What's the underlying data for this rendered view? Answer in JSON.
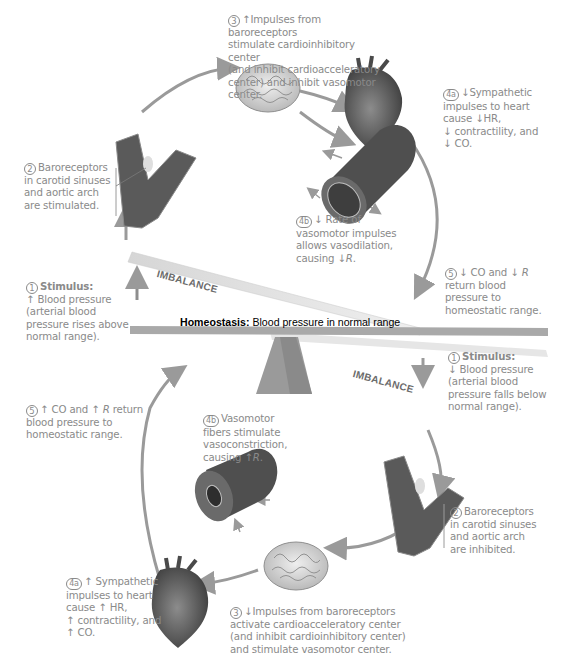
{
  "figure": {
    "header_fragment": "",
    "center": {
      "homeostasis_label": "Homeostasis:",
      "homeostasis_text": " Blood pressure in normal range",
      "imbalance_upper": "IMBALANCE",
      "imbalance_lower": "IMBALANCE"
    },
    "upper_cycle": {
      "step1": {
        "num": "1",
        "title": "Stimulus:",
        "lines": [
          "↑ Blood pressure",
          "(arterial blood",
          "pressure rises above",
          "normal range)."
        ]
      },
      "step2": {
        "num": "2",
        "lines": [
          "Baroreceptors",
          "in carotid sinuses",
          "and aortic arch",
          "are stimulated."
        ]
      },
      "step3": {
        "num": "3",
        "lines": [
          "↑Impulses from baroreceptors",
          "stimulate cardioinhibitory center",
          "(and inhibit cardioacceleratory",
          "center) and inhibit vasomotor",
          "center."
        ]
      },
      "step4a": {
        "num": "4a",
        "lines": [
          "↓Sympathetic",
          "impulses to heart",
          "cause ↓HR,",
          "↓ contractility, and",
          "↓ CO."
        ]
      },
      "step4b": {
        "num": "4b",
        "lines": [
          "↓ Rate of",
          "vasomotor impulses",
          "allows vasodilation,",
          "causing ↓"
        ],
        "r": "R",
        "end": "."
      },
      "step5": {
        "num": "5",
        "lines_first_a": "↓ CO and ↓ ",
        "r": "R",
        "lines": [
          "return blood",
          "pressure to",
          "homeostatic range."
        ]
      }
    },
    "lower_cycle": {
      "step1": {
        "num": "1",
        "title": "Stimulus:",
        "lines": [
          "↓ Blood pressure",
          "(arterial blood",
          "pressure falls below",
          "normal range)."
        ]
      },
      "step2": {
        "num": "2",
        "lines": [
          "Baroreceptors",
          "in carotid sinuses",
          "and aortic arch",
          "are inhibited."
        ]
      },
      "step3": {
        "num": "3",
        "lines": [
          "↓Impulses from baroreceptors",
          "activate cardioacceleratory center",
          "(and inhibit cardioinhibitory center)",
          "and stimulate vasomotor center."
        ]
      },
      "step4a": {
        "num": "4a",
        "lines": [
          "↑ Sympathetic",
          "impulses to heart",
          "cause ↑ HR,",
          "↑ contractility, and",
          "↑ CO."
        ]
      },
      "step4b": {
        "num": "4b",
        "lines": [
          "Vasomotor",
          "fibers stimulate",
          "vasoconstriction,",
          "causing ↑"
        ],
        "r": "R",
        "end": "."
      },
      "step5": {
        "num": "5",
        "first_a": "↑ CO and ↑ ",
        "r": "R",
        "first_b": " return",
        "lines": [
          "blood pressure to",
          "homeostatic range."
        ]
      }
    },
    "colors": {
      "text": "#8a8a8a",
      "arrow": "#9a9a9a",
      "vessel": "#6e6e6e",
      "beam": "#9c9c9c"
    }
  }
}
